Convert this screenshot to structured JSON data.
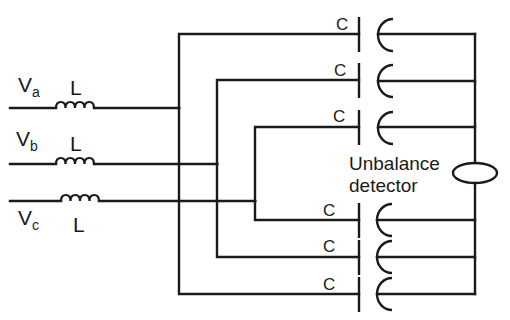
{
  "diagram": {
    "phases": [
      {
        "symbol": "V",
        "subscript": "a",
        "inductor_label": "L"
      },
      {
        "symbol": "V",
        "subscript": "b",
        "inductor_label": "L"
      },
      {
        "symbol": "V",
        "subscript": "c",
        "inductor_label": "L"
      }
    ],
    "capacitors": [
      {
        "label": "C"
      },
      {
        "label": "C"
      },
      {
        "label": "C"
      },
      {
        "label": "C"
      },
      {
        "label": "C"
      },
      {
        "label": "C"
      }
    ],
    "detector": {
      "line1": "Unbalance",
      "line2": "detector"
    },
    "colors": {
      "ink": "#1a1a1a",
      "background": "#ffffff"
    }
  }
}
